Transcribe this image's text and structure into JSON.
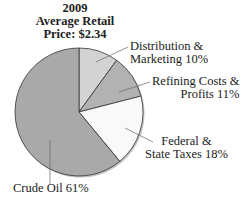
{
  "chart_data": {
    "type": "pie",
    "title": "2009 Average Retail Price: $2.34",
    "title_lines": [
      "2009",
      "Average Retail",
      "Price: $2.34"
    ],
    "slices": [
      {
        "label": "Distribution & Marketing",
        "value": 10,
        "color": "#d3d3d3"
      },
      {
        "label": "Refining Costs & Profits",
        "value": 11,
        "color": "#b2b2b2"
      },
      {
        "label": "Federal & State Taxes",
        "value": 18,
        "color": "#f9f9f9"
      },
      {
        "label": "Crude Oil",
        "value": 61,
        "color": "#a9a9a9"
      }
    ],
    "labels": {
      "dist": [
        "Distribution &",
        "Marketing 10%"
      ],
      "ref": [
        "Refining Costs &",
        "Profits 11%"
      ],
      "tax": [
        "Federal &",
        "State Taxes 18%"
      ],
      "crude": [
        "Crude Oil 61%"
      ]
    }
  }
}
